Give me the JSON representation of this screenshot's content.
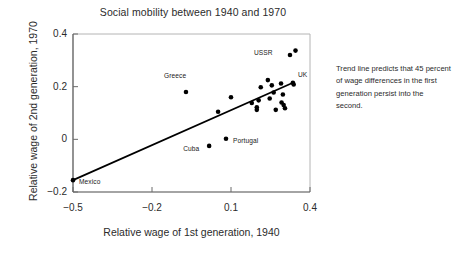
{
  "chart_data": {
    "type": "scatter",
    "title": "Social mobility between 1940 and 1970",
    "xlabel": "Relative wage of 1st generation, 1940",
    "ylabel": "Relative wage of 2nd generation, 1970",
    "xlim": [
      -0.5,
      0.4
    ],
    "ylim": [
      -0.2,
      0.4
    ],
    "xticks": [
      "-0.5",
      "-0.2",
      "0.1",
      "0.4"
    ],
    "xtick_values": [
      -0.5,
      -0.2,
      0.1,
      0.4
    ],
    "yticks": [
      "0.4",
      "0.2",
      "0",
      "-0.2"
    ],
    "ytick_values": [
      0.4,
      0.2,
      0.0,
      -0.2
    ],
    "grid": false,
    "legend": "none",
    "marker": "filled-circle",
    "marker_color": "#000000",
    "annotation": "Trend line predicts that 45 percent of wage differences in the first generation persist into the second.",
    "trendline": {
      "slope": 0.45,
      "x_start": -0.5,
      "y_start": -0.155,
      "x_end": 0.335,
      "y_end": 0.215,
      "color": "#000000"
    },
    "points": [
      {
        "label": "Mexico",
        "x": -0.5,
        "y": -0.155,
        "label_dx": 6,
        "label_dy": 2
      },
      {
        "label": "Greece",
        "x": -0.071,
        "y": 0.18,
        "label_dx": -22,
        "label_dy": -16
      },
      {
        "label": "Cuba",
        "x": 0.017,
        "y": -0.025,
        "label_dx": -26,
        "label_dy": 3
      },
      {
        "label": "Portugal",
        "x": 0.081,
        "y": 0.002,
        "label_dx": 7,
        "label_dy": 2
      },
      {
        "label": "USSR",
        "x": 0.324,
        "y": 0.32,
        "label_dx": -36,
        "label_dy": -2
      },
      {
        "label": "UK",
        "x": 0.335,
        "y": 0.215,
        "label_dx": 5,
        "label_dy": -8
      },
      {
        "label": "",
        "x": 0.051,
        "y": 0.105
      },
      {
        "label": "",
        "x": 0.1,
        "y": 0.16
      },
      {
        "label": "",
        "x": 0.179,
        "y": 0.138
      },
      {
        "label": "",
        "x": 0.213,
        "y": 0.198
      },
      {
        "label": "",
        "x": 0.205,
        "y": 0.148
      },
      {
        "label": "",
        "x": 0.198,
        "y": 0.122
      },
      {
        "label": "",
        "x": 0.198,
        "y": 0.112
      },
      {
        "label": "",
        "x": 0.24,
        "y": 0.225
      },
      {
        "label": "",
        "x": 0.255,
        "y": 0.205
      },
      {
        "label": "",
        "x": 0.247,
        "y": 0.155
      },
      {
        "label": "",
        "x": 0.262,
        "y": 0.178
      },
      {
        "label": "",
        "x": 0.27,
        "y": 0.112
      },
      {
        "label": "",
        "x": 0.29,
        "y": 0.212
      },
      {
        "label": "",
        "x": 0.297,
        "y": 0.17
      },
      {
        "label": "",
        "x": 0.3,
        "y": 0.13
      },
      {
        "label": "",
        "x": 0.292,
        "y": 0.14
      },
      {
        "label": "",
        "x": 0.305,
        "y": 0.118
      },
      {
        "label": "",
        "x": 0.345,
        "y": 0.337
      },
      {
        "label": "",
        "x": 0.338,
        "y": 0.208
      }
    ]
  }
}
